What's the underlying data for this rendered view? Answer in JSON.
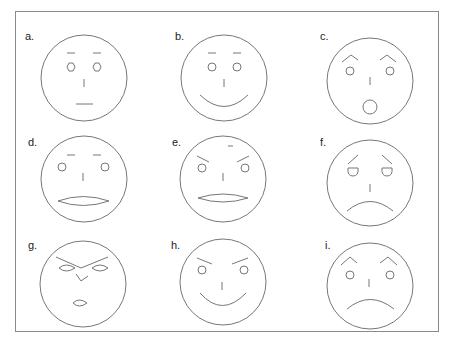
{
  "figure": {
    "title": "",
    "line_color": "#777777",
    "frame_color": "#8a8a8a",
    "faces": [
      {
        "label": "a.",
        "expression": "neutral",
        "eyes": "hexagon",
        "brows": "flat",
        "mouth": "straight-line"
      },
      {
        "label": "b.",
        "expression": "happy",
        "eyes": "round",
        "brows": "flat",
        "mouth": "smile"
      },
      {
        "label": "c.",
        "expression": "surprised",
        "eyes": "round",
        "brows": "arched",
        "mouth": "open-circle"
      },
      {
        "label": "d.",
        "expression": "neutral-open",
        "eyes": "round",
        "brows": "flat",
        "mouth": "lens-oval"
      },
      {
        "label": "e.",
        "expression": "angry",
        "eyes": "round",
        "brows": "slanted-down-inward",
        "mouth": "lens-oval"
      },
      {
        "label": "f.",
        "expression": "sad",
        "eyes": "droopy-half-circle",
        "brows": "slanted-up-inward",
        "mouth": "frown"
      },
      {
        "label": "g.",
        "expression": "angry-stylized",
        "eyes": "lens-oval",
        "brows": "v-shape",
        "mouth": "small-lens"
      },
      {
        "label": "h.",
        "expression": "sly-happy",
        "eyes": "round",
        "brows": "slanted-down-inward",
        "mouth": "smile"
      },
      {
        "label": "i.",
        "expression": "angry-sad",
        "eyes": "round",
        "brows": "arched",
        "mouth": "frown"
      }
    ]
  }
}
